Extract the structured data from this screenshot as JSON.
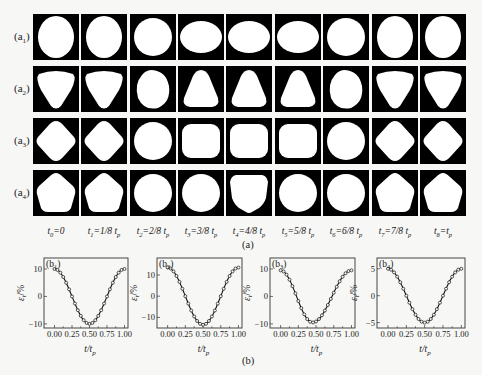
{
  "figure": {
    "part_a_caption": "(a)",
    "part_b_caption": "(b)",
    "row_labels": [
      {
        "main": "(a",
        "sub": "1",
        "close": ")"
      },
      {
        "main": "(a",
        "sub": "2",
        "close": ")"
      },
      {
        "main": "(a",
        "sub": "3",
        "close": ")"
      },
      {
        "main": "(a",
        "sub": "4",
        "close": ")"
      }
    ],
    "time_labels": [
      {
        "t": "t",
        "idx": "0",
        "rest": "=0",
        "tp": ""
      },
      {
        "t": "t",
        "idx": "1",
        "rest": "=1/8 t",
        "tp": "p"
      },
      {
        "t": "t",
        "idx": "2",
        "rest": "=2/8 t",
        "tp": "p"
      },
      {
        "t": "t",
        "idx": "3",
        "rest": "=3/8 t",
        "tp": "p"
      },
      {
        "t": "t",
        "idx": "4",
        "rest": "=4/8 t",
        "tp": "p"
      },
      {
        "t": "t",
        "idx": "5",
        "rest": "=5/8 t",
        "tp": "p"
      },
      {
        "t": "t",
        "idx": "6",
        "rest": "=6/8 t",
        "tp": "p"
      },
      {
        "t": "t",
        "idx": "7",
        "rest": "=7/8 t",
        "tp": "p"
      },
      {
        "t": "t",
        "idx": "8",
        "rest": "=t",
        "tp": "p"
      }
    ],
    "shapes": [
      [
        "ellipse-tall",
        "ellipse-tall",
        "circle",
        "ellipse-wide",
        "ellipse-wide",
        "ellipse-wide",
        "circle",
        "ellipse-tall",
        "ellipse-tall"
      ],
      [
        "triangle-down",
        "triangle-down",
        "egg-tilt",
        "triangle-up",
        "triangle-up",
        "triangle-up",
        "egg-tilt",
        "triangle-down",
        "triangle-down"
      ],
      [
        "diamond",
        "diamond",
        "circle",
        "rounded-square",
        "rounded-square",
        "rounded-square",
        "circle",
        "diamond",
        "diamond"
      ],
      [
        "pentagon-up",
        "pentagon-up",
        "circle",
        "circle",
        "pentagon-down",
        "circle",
        "circle",
        "pentagon-up",
        "pentagon-up"
      ]
    ]
  },
  "chart_data": [
    {
      "type": "line",
      "panel": "(b1)",
      "panel_main": "(b",
      "panel_sub": "1",
      "xlabel": "t/t_p",
      "xlabel_main": "t/t",
      "xlabel_sub": "p",
      "ylabel": "ε_t/%",
      "ylabel_main": "ε",
      "ylabel_sub": "t",
      "ylabel_rest": "/%",
      "xlim": [
        -0.15,
        1.05
      ],
      "ylim": [
        -11.5,
        14
      ],
      "xticks": [
        0.0,
        0.25,
        0.5,
        0.75,
        1.0
      ],
      "xtick_labels": [
        "0.00",
        "0.25",
        "0.50",
        "0.75",
        "1.00"
      ],
      "yticks": [
        -10,
        0,
        10
      ],
      "ytick_labels": [
        "-10",
        "0",
        "10"
      ],
      "amplitude": 10,
      "phase_min": 0.5,
      "markers": "open-circle"
    },
    {
      "type": "line",
      "panel": "(b2)",
      "panel_main": "(b",
      "panel_sub": "2",
      "xlabel": "t/t_p",
      "xlabel_main": "t/t",
      "xlabel_sub": "p",
      "ylabel": "ε_t/%",
      "ylabel_main": "ε",
      "ylabel_sub": "t",
      "ylabel_rest": "/%",
      "xlim": [
        -0.15,
        1.05
      ],
      "ylim": [
        -15,
        18
      ],
      "xticks": [
        0.0,
        0.25,
        0.5,
        0.75,
        1.0
      ],
      "xtick_labels": [
        "0.00",
        "0.25",
        "0.50",
        "0.75",
        "1.00"
      ],
      "yticks": [
        -10,
        0,
        10
      ],
      "ytick_labels": [
        "-10",
        "0",
        "10"
      ],
      "amplitude": 13.5,
      "phase_min": 0.5,
      "markers": "open-circle"
    },
    {
      "type": "line",
      "panel": "(b3)",
      "panel_main": "(b",
      "panel_sub": "3",
      "xlabel": "t/t_p",
      "xlabel_main": "t/t",
      "xlabel_sub": "p",
      "ylabel": "ε_t/%",
      "ylabel_main": "ε",
      "ylabel_sub": "t",
      "ylabel_rest": "/%",
      "xlim": [
        -0.15,
        1.05
      ],
      "ylim": [
        -11.5,
        14
      ],
      "xticks": [
        0.0,
        0.25,
        0.5,
        0.75,
        1.0
      ],
      "xtick_labels": [
        "0.00",
        "0.25",
        "0.50",
        "0.75",
        "1.00"
      ],
      "yticks": [
        -10,
        0,
        10
      ],
      "ytick_labels": [
        "-10",
        "0",
        "10"
      ],
      "amplitude": 9.5,
      "phase_min": 0.45,
      "markers": "open-circle"
    },
    {
      "type": "line",
      "panel": "(b4)",
      "panel_main": "(b",
      "panel_sub": "4",
      "xlabel": "t/t_p",
      "xlabel_main": "t/t",
      "xlabel_sub": "p",
      "ylabel": "ε_t/%",
      "ylabel_main": "ε",
      "ylabel_sub": "t",
      "ylabel_rest": "/%",
      "xlim": [
        -0.15,
        1.05
      ],
      "ylim": [
        -6,
        7
      ],
      "xticks": [
        0.0,
        0.25,
        0.5,
        0.75,
        1.0
      ],
      "xtick_labels": [
        "0.00",
        "0.25",
        "0.50",
        "0.75",
        "1.00"
      ],
      "yticks": [
        -5,
        0,
        5
      ],
      "ytick_labels": [
        "-5",
        "0",
        "5"
      ],
      "amplitude": 5,
      "phase_min": 0.5,
      "markers": "open-circle"
    }
  ]
}
